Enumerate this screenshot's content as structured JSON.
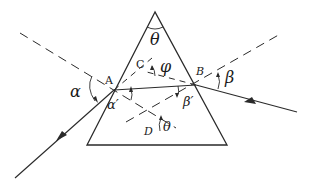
{
  "diagram": {
    "type": "prism-refraction",
    "colors": {
      "line": "#2a2a2a",
      "background": "#ffffff"
    },
    "labels": {
      "apex_angle": "θ",
      "deviation_angle": "φ",
      "incidence_angle": "α",
      "refraction_angle_A": "α′",
      "refraction_angle_B": "β′",
      "emergence_angle": "β",
      "inner_angle_D": "θ",
      "point_A": "A",
      "point_B": "B",
      "point_C": "C",
      "point_D": "D"
    }
  }
}
